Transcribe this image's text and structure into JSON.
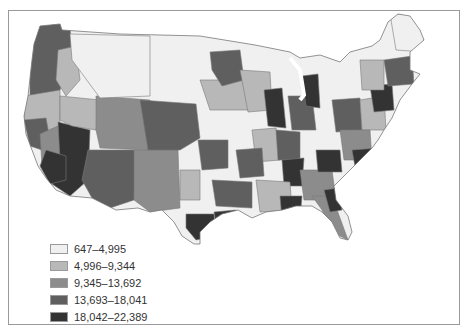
{
  "map": {
    "type": "choropleth",
    "region": "Contiguous United States",
    "colors": [
      "#f0f0f0",
      "#b8b8b8",
      "#8c8c8c",
      "#5f5f5f",
      "#333333"
    ],
    "border_color": "#7a7a7a"
  },
  "legend": {
    "items": [
      {
        "label": "647–4,995",
        "color": "#f0f0f0"
      },
      {
        "label": "4,996–9,344",
        "color": "#b8b8b8"
      },
      {
        "label": "9,345–13,692",
        "color": "#8c8c8c"
      },
      {
        "label": "13,693–18,041",
        "color": "#5f5f5f"
      },
      {
        "label": "18,042–22,389",
        "color": "#333333"
      }
    ]
  }
}
